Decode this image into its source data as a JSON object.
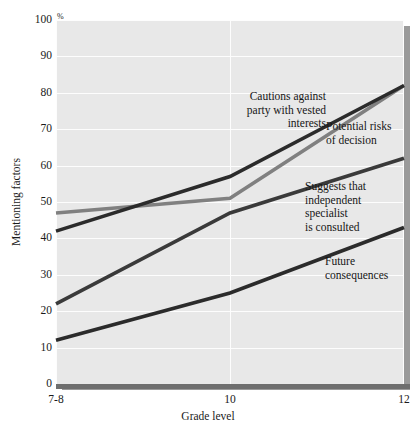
{
  "chart_data": {
    "type": "line",
    "title": "",
    "xlabel": "Grade level",
    "ylabel": "Mentioning factors",
    "unit_label": "%",
    "categories": [
      "7-8",
      "10",
      "12"
    ],
    "x": [
      0,
      1,
      2
    ],
    "ylim": [
      0,
      100
    ],
    "yticks": [
      0,
      10,
      20,
      30,
      40,
      50,
      60,
      70,
      80,
      90,
      100
    ],
    "grid": true,
    "legend_position": "inline-annotations",
    "series": [
      {
        "name": "Cautions against party with vested interests",
        "label": "Cautions against\nparty with vested\ninterests",
        "color": "#808080",
        "values": [
          47,
          51,
          82
        ]
      },
      {
        "name": "Potential risks of decision",
        "label": "Potential risks\nof decision",
        "color": "#2b2b2b",
        "values": [
          42,
          57,
          82
        ]
      },
      {
        "name": "Suggests that independent specialist is consulted",
        "label": "Suggests that\nindependent\nspecialist\nis consulted",
        "color": "#3a3a3a",
        "values": [
          22,
          47,
          62
        ]
      },
      {
        "name": "Future consequences",
        "label": "Future\nconsequences",
        "color": "#2b2b2b",
        "values": [
          12,
          25,
          43
        ]
      }
    ]
  },
  "colors": {
    "plot_background": "#e8e8e8",
    "page_background": "#ffffff",
    "gridline": "#fdfdfd",
    "axis": "#6e6e6e",
    "shadow": "#9a9a9a",
    "text": "#1a1a1a"
  }
}
